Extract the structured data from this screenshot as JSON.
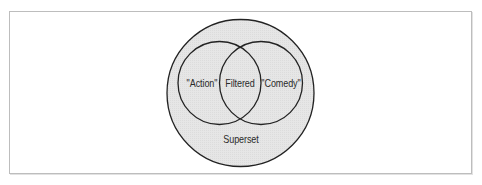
{
  "diagram": {
    "type": "venn",
    "colors": {
      "superset_fill": "#e6e6e6",
      "stroke": "#222222",
      "frame_border": "#bdbdbd",
      "background": "#ffffff",
      "text": "#2a2a2a"
    },
    "sets": {
      "superset": {
        "label": "Superset"
      },
      "left": {
        "label": "\"Action\""
      },
      "right": {
        "label": "\"Comedy\""
      },
      "intersection": {
        "label": "Filtered"
      }
    }
  }
}
